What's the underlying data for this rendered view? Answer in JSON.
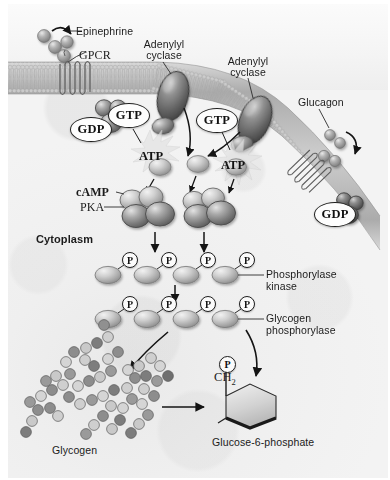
{
  "figure": {
    "cell_compartment_label": "Cytoplasm"
  },
  "labels": {
    "epinephrine": "Epinephrine",
    "gpcr": "GPCR",
    "adenylyl_cyclase_left_line1": "Adenylyl",
    "adenylyl_cyclase_left_line2": "cyclase",
    "adenylyl_cyclase_right_line1": "Adenylyl",
    "adenylyl_cyclase_right_line2": "cyclase",
    "glucagon": "Glucagon",
    "gdp_left": "GDP",
    "gdp_right": "GDP",
    "gtp_left": "GTP",
    "gtp_right": "GTP",
    "atp_left": "ATP",
    "atp_right": "ATP",
    "camp": "cAMP",
    "pka": "PKA",
    "cytoplasm": "Cytoplasm",
    "phosphorylase_kinase_line1": "Phosphorylase",
    "phosphorylase_kinase_line2": "kinase",
    "glycogen_phosphorylase_line1": "Glycogen",
    "glycogen_phosphorylase_line2": "phosphorylase",
    "glycogen": "Glycogen",
    "glucose6phosphate": "Glucose-6-phosphate",
    "ch2": "CH",
    "ch2_sub": "2",
    "phosphate_symbol": "P"
  },
  "phospho_rows": {
    "phosphorylase_kinase_count": 4,
    "glycogen_phosphorylase_count": 4
  },
  "colors": {
    "background": "#ffffff",
    "cytoplasm": "#efefef",
    "extracellular": "#f7f7f7",
    "membrane": "#b9b9b9",
    "protein_dark": "#6e6e6e",
    "protein_mid": "#9a9a9a",
    "protein_light": "#c9c9c9",
    "outline": "#1d1d1d",
    "text": "#1b1b1b",
    "pill_fill": "#fdfdfd",
    "starburst": "#e4e4e4"
  }
}
